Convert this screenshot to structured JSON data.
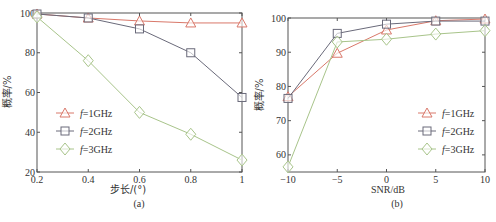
{
  "chart_data": [
    {
      "type": "line",
      "panel": "(a)",
      "xlabel": "步长/(°)",
      "ylabel": "概率/%",
      "x": [
        0.2,
        0.4,
        0.6,
        0.8,
        1.0
      ],
      "xticks": [
        "0.2",
        "0.4",
        "0.6",
        "0.8",
        "1"
      ],
      "yticks": [
        "20",
        "40",
        "60",
        "80",
        "100"
      ],
      "xlim": [
        0.2,
        1.0
      ],
      "ylim": [
        20,
        100
      ],
      "grid": false,
      "legend_position": "center-left",
      "series": [
        {
          "name": "f=1GHz",
          "marker": "triangle",
          "color": "#d9786a",
          "values": [
            99.5,
            97.5,
            96,
            95,
            95
          ]
        },
        {
          "name": "f=2GHz",
          "marker": "square",
          "color": "#6a6a7a",
          "values": [
            99.5,
            97.5,
            92,
            80,
            57.5
          ]
        },
        {
          "name": "f=3GHz",
          "marker": "diamond",
          "color": "#a8c48a",
          "values": [
            98,
            76,
            50,
            39,
            26
          ]
        }
      ]
    },
    {
      "type": "line",
      "panel": "(b)",
      "xlabel": "SNR/dB",
      "ylabel": "概率/%",
      "x": [
        -10,
        -5,
        0,
        5,
        10
      ],
      "xticks": [
        "−10",
        "−5",
        "0",
        "5",
        "10"
      ],
      "yticks": [
        "60",
        "70",
        "80",
        "90",
        "100"
      ],
      "xlim": [
        -10,
        10
      ],
      "ylim": [
        55,
        100
      ],
      "grid": false,
      "legend_position": "lower-right",
      "series": [
        {
          "name": "f=1GHz",
          "marker": "triangle",
          "color": "#d9786a",
          "values": [
            77,
            89.7,
            96.5,
            99.2,
            99.7
          ]
        },
        {
          "name": "f=2GHz",
          "marker": "square",
          "color": "#6a6a7a",
          "values": [
            76.5,
            95.5,
            98.2,
            99.1,
            99.1
          ]
        },
        {
          "name": "f=3GHz",
          "marker": "diamond",
          "color": "#a8c48a",
          "values": [
            56.5,
            93,
            93.8,
            95.3,
            96.3
          ]
        }
      ]
    }
  ],
  "legend": {
    "items": [
      {
        "prefix": "f",
        "suffix": "=1GHz"
      },
      {
        "prefix": "f",
        "suffix": "=2GHz"
      },
      {
        "prefix": "f",
        "suffix": "=3GHz"
      }
    ]
  },
  "captions": {
    "a": "(a)",
    "b": "(b)"
  }
}
